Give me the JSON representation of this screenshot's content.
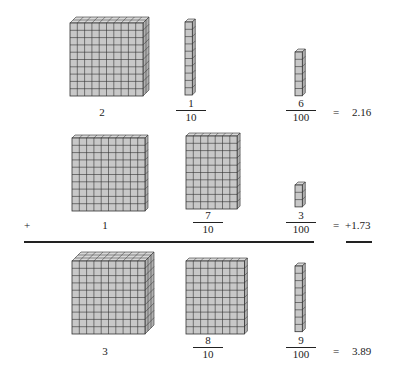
{
  "rows": [
    {
      "ones": {
        "label": "2",
        "flats": 2
      },
      "tenths": {
        "numerator": "1",
        "denominator": "10",
        "rods": 1
      },
      "hundredths": {
        "numerator": "6",
        "denominator": "100",
        "cubes": 6
      },
      "equals": "=",
      "value": "2.16"
    },
    {
      "operator": "+",
      "ones": {
        "label": "1",
        "flats": 1
      },
      "tenths": {
        "numerator": "7",
        "denominator": "10",
        "rods": 7
      },
      "hundredths": {
        "numerator": "3",
        "denominator": "100",
        "cubes": 3
      },
      "equals": "=",
      "value": "+1.73"
    },
    {
      "ones": {
        "label": "3",
        "flats": 3
      },
      "tenths": {
        "numerator": "8",
        "denominator": "10",
        "rods": 8
      },
      "hundredths": {
        "numerator": "9",
        "denominator": "100",
        "cubes": 9
      },
      "equals": "=",
      "value": "3.89"
    }
  ],
  "colors": {
    "block_fill": "#c8c8c8",
    "block_top": "#d8d8d8",
    "block_side": "#b0b0b0",
    "grid_line": "#333333",
    "rule": "#222222"
  }
}
